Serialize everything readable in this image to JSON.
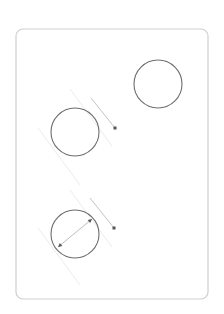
{
  "diagram": {
    "frame": {
      "x": 16,
      "y": 29,
      "width": 192,
      "height": 270,
      "radius": 7,
      "stroke": "#cfcfcf"
    },
    "circles": [
      {
        "id": "circle-top-right",
        "cx": 158,
        "cy": 84,
        "r": 24
      },
      {
        "id": "circle-middle-left",
        "cx": 75,
        "cy": 132,
        "r": 24
      },
      {
        "id": "circle-bottom-left",
        "cx": 75,
        "cy": 234,
        "r": 24
      }
    ],
    "guides": [
      {
        "x1": 70,
        "y1": 89,
        "x2": 112,
        "y2": 146
      },
      {
        "x1": 38,
        "y1": 128,
        "x2": 80,
        "y2": 185
      },
      {
        "x1": 70,
        "y1": 190,
        "x2": 112,
        "y2": 247
      },
      {
        "x1": 38,
        "y1": 228,
        "x2": 80,
        "y2": 285
      }
    ],
    "rays": [
      {
        "x1": 91,
        "y1": 98,
        "x2": 115,
        "y2": 128,
        "dot": {
          "cx": 115,
          "cy": 128
        }
      },
      {
        "x1": 90,
        "y1": 198,
        "x2": 114,
        "y2": 228,
        "dot": {
          "cx": 114,
          "cy": 228
        }
      }
    ],
    "diameter": {
      "x1": 58,
      "y1": 247,
      "x2": 92,
      "y2": 219
    },
    "colors": {
      "circle": "#6e6e6e",
      "guide": "#ececec",
      "ray": "#c4c4c4",
      "dot": "#555555"
    }
  }
}
